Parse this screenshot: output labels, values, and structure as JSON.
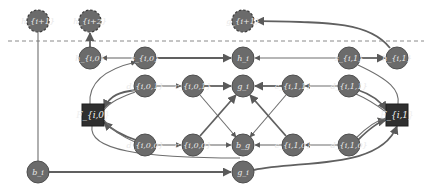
{
  "diagram": {
    "type": "directed graph",
    "colors": {
      "node_fill": "#6b6b6b",
      "square_fill": "#2f2f2f",
      "edge": "#6e6e6e",
      "background": "#ffffff"
    },
    "nodes": {
      "h_next": "h_{i+1}",
      "h_next2": "h_{i+2}",
      "g_next": "g_{i+1}",
      "h_i0": "h_{i,0}",
      "s_i0": "s_{i,0}",
      "h_i": "h_i",
      "s_i1": "s_{i,1}",
      "h_i1": "h_{i,1}",
      "d_i01": "d_{i,0,1}",
      "c_i01": "c_{i,0,1}",
      "g_i_mid": "g_i",
      "c_i11": "c_{i,1,1}",
      "d_i11": "d_{i,1,1}",
      "F_i0": "F_{i,0}",
      "F_i1": "F_{i,1}",
      "d_i00": "d_{i,0,0}",
      "c_i00": "c_{i,0,0}",
      "b_g": "b_g",
      "c_i10": "c_{i,1,0}",
      "d_i10": "d_{i,1,0}",
      "b_i": "b_i",
      "g_i_bottom": "g_i"
    }
  }
}
